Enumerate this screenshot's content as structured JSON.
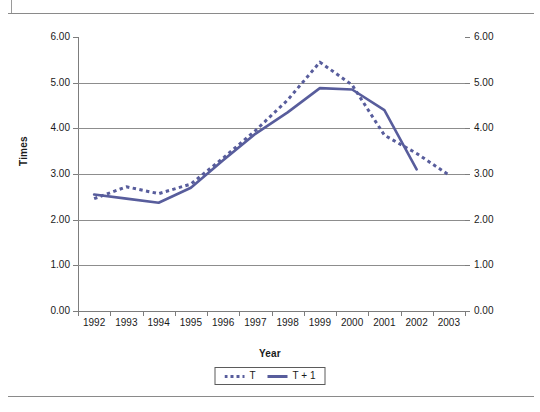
{
  "page": {
    "background_color": "#ffffff",
    "rule_color": "#8a8a8a"
  },
  "chart_data": {
    "type": "line",
    "title": "",
    "xlabel": "Year",
    "ylabel": "Times",
    "categories": [
      "1992",
      "1993",
      "1994",
      "1995",
      "1996",
      "1997",
      "1998",
      "1999",
      "2000",
      "2001",
      "2002",
      "2003"
    ],
    "ylim": [
      0.0,
      6.0
    ],
    "ytick_labels": [
      "0.00",
      "1.00",
      "2.00",
      "3.00",
      "4.00",
      "5.00",
      "6.00"
    ],
    "ytick_values": [
      0,
      1,
      2,
      3,
      4,
      5,
      6
    ],
    "right_axis": {
      "shown": true,
      "ylim": [
        0.0,
        6.0
      ],
      "ytick_labels": [
        "0.00",
        "1.00",
        "2.00",
        "3.00",
        "4.00",
        "5.00",
        "6.00"
      ]
    },
    "grid": "horizontal",
    "legend_position": "bottom",
    "series": [
      {
        "name": "T",
        "style": "dotted",
        "color": "#585d9c",
        "x": [
          "1992",
          "1993",
          "1994",
          "1995",
          "1996",
          "1997",
          "1998",
          "1999",
          "2000",
          "2001",
          "2002",
          "2003"
        ],
        "values": [
          2.46,
          2.72,
          2.57,
          2.78,
          3.35,
          3.95,
          4.62,
          5.45,
          4.95,
          3.85,
          3.45,
          2.98
        ]
      },
      {
        "name": "T + 1",
        "style": "solid",
        "color": "#585d9c",
        "x": [
          "1992",
          "1993",
          "1994",
          "1995",
          "1996",
          "1997",
          "1998",
          "1999",
          "2000",
          "2001",
          "2002"
        ],
        "values": [
          2.55,
          2.46,
          2.37,
          2.7,
          3.3,
          3.88,
          4.35,
          4.88,
          4.85,
          4.4,
          3.1
        ]
      }
    ]
  },
  "legend": {
    "items": [
      {
        "label": "T",
        "style": "dotted"
      },
      {
        "label": "T + 1",
        "style": "solid"
      }
    ]
  },
  "colors": {
    "series": "#585d9c",
    "grid": "#8d8d8d",
    "axis": "#7d7d7d",
    "text": "#111111"
  }
}
